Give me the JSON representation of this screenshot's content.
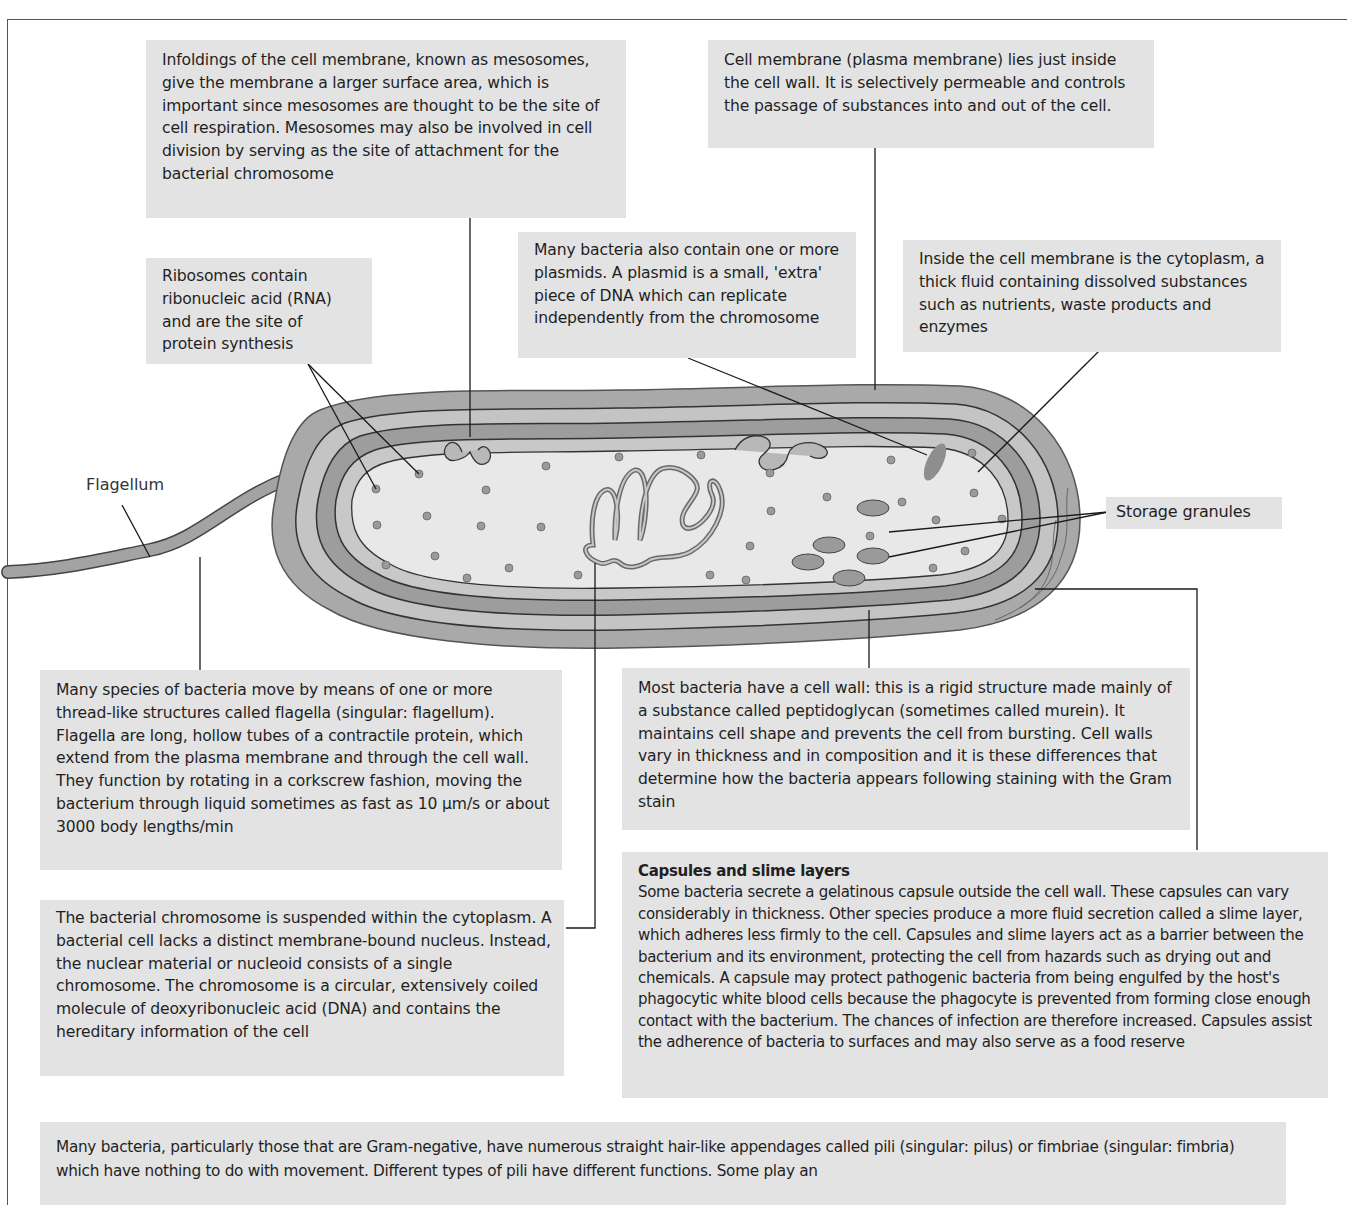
{
  "diagram": {
    "labels": {
      "flagellum": "Flagellum",
      "storage_granules": "Storage granules"
    },
    "annotations": {
      "mesosomes": "Infoldings of the cell membrane, known as mesosomes, give the membrane a larger surface area, which is important since mesosomes are thought to be the site of cell respiration. Mesosomes may also be involved in cell division by serving as the site of attachment for the bacterial chromosome",
      "cell_membrane": "Cell membrane (plasma membrane) lies just inside the cell wall. It is selectively permeable and controls the passage of substances into and out of the cell.",
      "ribosomes": "Ribosomes contain ribonucleic acid (RNA) and are the site of protein synthesis",
      "plasmids": "Many bacteria also contain one or more plasmids. A plasmid is a small, 'extra' piece of DNA which can replicate independently from the chromosome",
      "cytoplasm": "Inside the cell membrane is the cytoplasm, a thick fluid containing dissolved substances such as nutrients, waste products and enzymes",
      "flagella": "Many species of bacteria move by means of one or more thread-like structures called flagella (singular: flagellum). Flagella are long, hollow tubes of a contractile protein, which extend from the plasma membrane and through the cell wall. They function by rotating in a corkscrew fashion, moving the bacterium through liquid sometimes as fast as 10 μm/s or about 3000 body lengths/min",
      "cell_wall": "Most bacteria have a cell wall: this is a rigid structure made mainly of a substance called peptidoglycan (sometimes called murein). It maintains cell shape and prevents the cell from bursting. Cell walls vary in thickness and in composition and it is these differences that determine how the bacteria appears following staining with the Gram stain",
      "chromosome": "The bacterial chromosome is suspended within the cytoplasm. A bacterial cell lacks a distinct membrane-bound nucleus. Instead, the nuclear material or nucleoid consists of a single chromosome. The chromosome is a circular, extensively coiled molecule of deoxyribonucleic acid (DNA) and contains the hereditary information of the cell",
      "capsule_title": "Capsules and slime layers",
      "capsule": "Some bacteria secrete a gelatinous capsule outside the cell wall. These capsules can vary considerably in thickness. Other species produce a more fluid secretion called a slime layer, which adheres less firmly to the cell. Capsules and slime layers act as a barrier between the bacterium and its environment, protecting the cell from hazards such as drying out and chemicals. A capsule may protect pathogenic bacteria from being engulfed by the host's phagocytic white blood cells because the phagocyte is prevented from forming close enough contact with the bacterium. The chances of infection are therefore increased. Capsules assist the adherence of bacteria to surfaces and may also serve as a food reserve",
      "pili": "Many bacteria, particularly those that are Gram-negative, have numerous straight hair-like appendages called pili (singular: pilus) or fimbriae (singular: fimbria) which have nothing to do with movement. Different types of pili have different functions. Some play an"
    },
    "colors": {
      "box_fill": "#e3e3e3",
      "capsule": "#a9a9a9",
      "cell_wall": "#c6c6c6",
      "wall_band": "#9d9d9d",
      "cytoplasm": "#e8e8e8",
      "organelle": "#8e8e8e",
      "line": "#1a1a1a"
    }
  }
}
